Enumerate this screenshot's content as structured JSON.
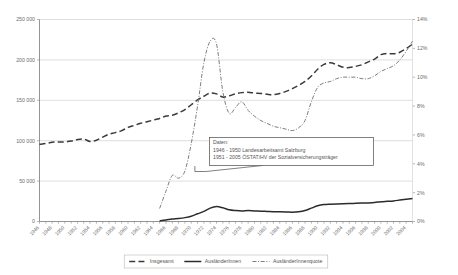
{
  "chart_data": {
    "type": "line",
    "title": "",
    "xlabel": "",
    "ylabel": "",
    "ylim": [
      0,
      250000
    ],
    "y2lim": [
      0,
      14
    ],
    "grid": true,
    "legend_position": "bottom",
    "x": [
      1946,
      1947,
      1948,
      1949,
      1950,
      1951,
      1952,
      1953,
      1954,
      1955,
      1956,
      1957,
      1958,
      1959,
      1960,
      1961,
      1962,
      1963,
      1964,
      1965,
      1966,
      1967,
      1968,
      1969,
      1970,
      1971,
      1972,
      1973,
      1974,
      1975,
      1976,
      1977,
      1978,
      1979,
      1980,
      1981,
      1982,
      1983,
      1984,
      1985,
      1986,
      1987,
      1988,
      1989,
      1990,
      1991,
      1992,
      1993,
      1994,
      1995,
      1996,
      1997,
      1998,
      1999,
      2000,
      2001,
      2002,
      2003,
      2004,
      2005
    ],
    "xtick_labels": [
      "1946",
      "1948",
      "1950",
      "1952",
      "1954",
      "1956",
      "1958",
      "1960",
      "1962",
      "1964",
      "1966",
      "1968",
      "1970",
      "1972",
      "1974",
      "1976",
      "1978",
      "1980",
      "1982",
      "1984",
      "1986",
      "1988",
      "1990",
      "1992",
      "1994",
      "1996",
      "1998",
      "2000",
      "2002",
      "2004"
    ],
    "ytick_labels": [
      "0",
      "50 000",
      "100 000",
      "150 000",
      "200 000",
      "250 000"
    ],
    "ytick_values": [
      0,
      50000,
      100000,
      150000,
      200000,
      250000
    ],
    "y2tick_labels": [
      "0%",
      "2%",
      "4%",
      "6%",
      "8%",
      "10%",
      "12%",
      "14%"
    ],
    "y2tick_values": [
      0,
      2,
      4,
      6,
      8,
      10,
      12,
      14
    ],
    "series": [
      {
        "name": "Insgesamt",
        "axis": "left",
        "style": "dashed",
        "color": "#3a3a3a",
        "values": [
          95500,
          96500,
          98000,
          98500,
          98500,
          99500,
          101500,
          102000,
          99000,
          100500,
          104500,
          108000,
          110000,
          112500,
          116500,
          119000,
          121500,
          123500,
          125500,
          127500,
          130500,
          131500,
          134500,
          138500,
          144500,
          150500,
          155000,
          159000,
          158000,
          154000,
          155500,
          158000,
          159500,
          160000,
          159000,
          158500,
          157500,
          157000,
          158500,
          161000,
          164500,
          168500,
          173500,
          180000,
          188500,
          194500,
          196500,
          194000,
          191000,
          190500,
          192000,
          194000,
          197500,
          201000,
          206500,
          208000,
          207500,
          209500,
          214000,
          219500
        ],
        "values_note": "Gesamtzahl der unselbständig Beschäftigten"
      },
      {
        "name": "AusländerInnen",
        "axis": "left",
        "style": "solid",
        "color": "#2b2b2b",
        "values": [
          null,
          null,
          null,
          null,
          null,
          null,
          null,
          null,
          null,
          null,
          null,
          null,
          null,
          null,
          null,
          null,
          null,
          null,
          null,
          700,
          1800,
          3200,
          3800,
          4800,
          6500,
          9500,
          12500,
          16500,
          18500,
          17000,
          14500,
          13500,
          13000,
          13500,
          13000,
          12800,
          12500,
          12200,
          12000,
          11800,
          11500,
          12000,
          13500,
          16500,
          19500,
          21000,
          21500,
          21800,
          22000,
          22200,
          22500,
          22800,
          23000,
          23500,
          24500,
          25000,
          25500,
          26500,
          27500,
          28500
        ]
      },
      {
        "name": "AusländerInnenquote",
        "axis": "right",
        "style": "dash-dot",
        "color": "#6e6e6e",
        "values": [
          null,
          null,
          null,
          null,
          null,
          null,
          null,
          null,
          null,
          null,
          null,
          null,
          null,
          null,
          null,
          null,
          null,
          null,
          null,
          0.9,
          2.1,
          3.2,
          3.0,
          3.5,
          5.4,
          8.0,
          11.0,
          12.5,
          12.3,
          9.0,
          7.5,
          7.9,
          8.3,
          7.7,
          7.3,
          7.0,
          6.8,
          6.6,
          6.5,
          6.4,
          6.3,
          6.5,
          7.0,
          8.3,
          9.3,
          9.6,
          9.7,
          9.9,
          10.0,
          10.0,
          10.0,
          9.9,
          9.9,
          10.1,
          10.4,
          10.6,
          10.8,
          11.2,
          11.8,
          12.5
        ]
      }
    ],
    "annotation": {
      "lines": [
        "Daten:",
        "1946 - 1950 Landesarbeitsamt Salzburg",
        "1951 - 2005 ÖSTAT/HV der Sozialversicherungsträger"
      ],
      "pointer_target_year": 1972
    }
  },
  "legend": {
    "items": [
      {
        "label": "Insgesamt",
        "style": "dashed"
      },
      {
        "label": "AusländerInnen",
        "style": "solid"
      },
      {
        "label": "AusländerInnenquote",
        "style": "dash-dot"
      }
    ]
  },
  "colors": {
    "total": "#3a3a3a",
    "foreign": "#2b2b2b",
    "quota": "#6e6e6e",
    "grid": "#c8c8c8",
    "axis": "#7a7a7a",
    "text": "#6b6b6b",
    "background": "#ffffff"
  }
}
